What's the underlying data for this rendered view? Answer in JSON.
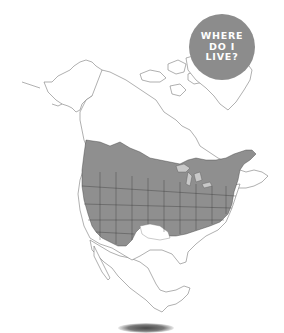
{
  "badge": {
    "lines": [
      "WHERE",
      "DO I",
      "LIVE?"
    ],
    "color": "#8c8c8c",
    "text_color": "#ffffff"
  },
  "map": {
    "subject": "North America range map",
    "range_fill": "#8f8f8f",
    "land_fill": "#ffffff",
    "border_color": "#7a7a7a",
    "range_border_color": "#3a3a3a"
  }
}
